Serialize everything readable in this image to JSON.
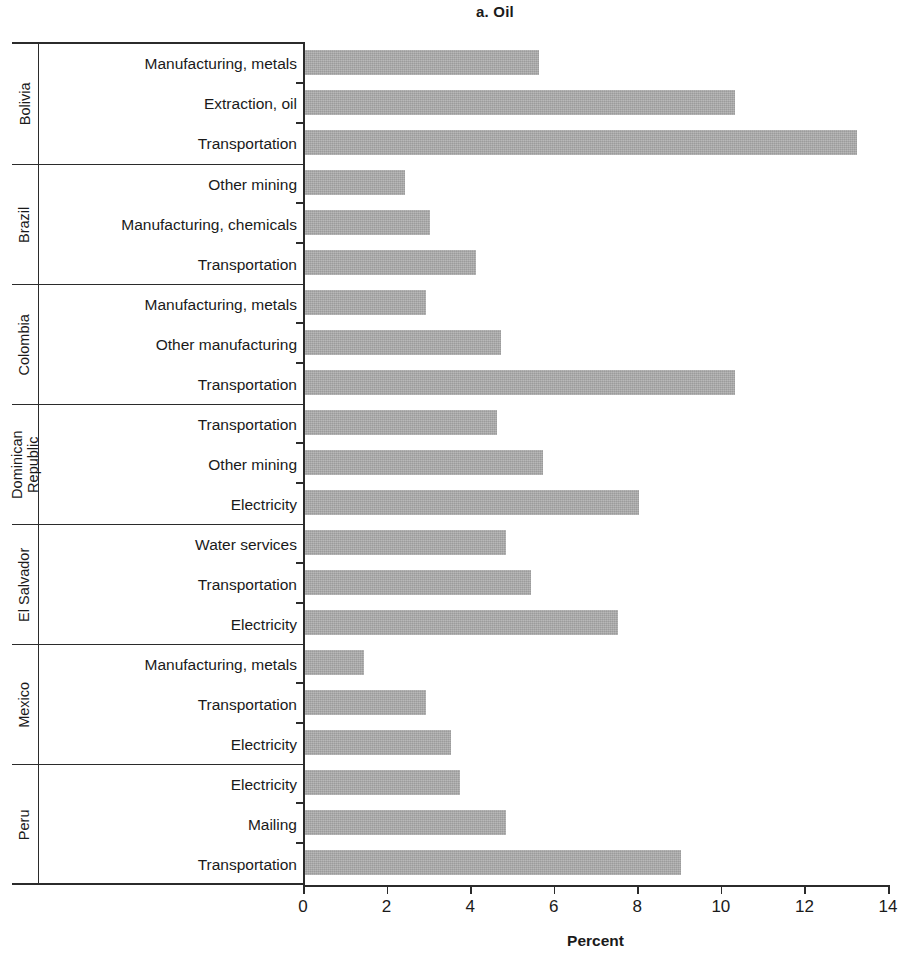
{
  "chart": {
    "title": "a. Oil",
    "xlabel": "Percent",
    "ticks": [
      "0",
      "2",
      "4",
      "6",
      "8",
      "10",
      "12",
      "14"
    ]
  },
  "chart_data": {
    "type": "bar",
    "orientation": "horizontal",
    "title": "a. Oil",
    "xlabel": "Percent",
    "ylabel": "",
    "xlim": [
      0,
      14
    ],
    "xticks": [
      0,
      2,
      4,
      6,
      8,
      10,
      12,
      14
    ],
    "grid": false,
    "legend": null,
    "bar_color": "#a9a9a9",
    "groups": [
      {
        "country": "Bolivia",
        "categories": [
          "Manufacturing, metals",
          "Extraction, oil",
          "Transportation"
        ],
        "values": [
          5.6,
          10.3,
          13.2
        ]
      },
      {
        "country": "Brazil",
        "categories": [
          "Other mining",
          "Manufacturing, chemicals",
          "Transportation"
        ],
        "values": [
          2.4,
          3.0,
          4.1
        ]
      },
      {
        "country": "Colombia",
        "categories": [
          "Manufacturing, metals",
          "Other manufacturing",
          "Transportation"
        ],
        "values": [
          2.9,
          4.7,
          10.3
        ]
      },
      {
        "country": "Dominican Republic",
        "categories": [
          "Transportation",
          "Other mining",
          "Electricity"
        ],
        "values": [
          4.6,
          5.7,
          8.0
        ]
      },
      {
        "country": "El Salvador",
        "categories": [
          "Water services",
          "Transportation",
          "Electricity"
        ],
        "values": [
          4.8,
          5.4,
          7.5
        ]
      },
      {
        "country": "Mexico",
        "categories": [
          "Manufacturing, metals",
          "Transportation",
          "Electricity"
        ],
        "values": [
          1.4,
          2.9,
          3.5
        ]
      },
      {
        "country": "Peru",
        "categories": [
          "Electricity",
          "Mailing",
          "Transportation"
        ],
        "values": [
          3.7,
          4.8,
          9.0
        ]
      }
    ]
  }
}
